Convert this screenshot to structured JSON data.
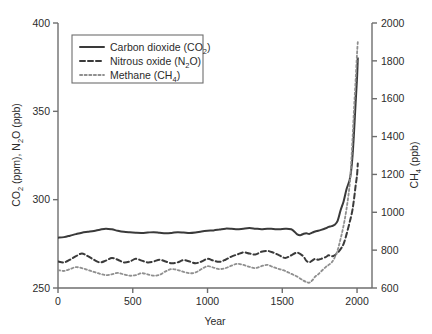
{
  "chart_data": {
    "type": "line",
    "title": "",
    "xlabel": "Year",
    "ylabel_left": "CO2 (ppm), N2O (ppb)",
    "ylabel_right": "CH4 (ppb)",
    "xlim": [
      0,
      2100
    ],
    "ylim_left": [
      250,
      400
    ],
    "ylim_right": [
      600,
      2000
    ],
    "xticks": [
      0,
      500,
      1000,
      1500,
      2000
    ],
    "yticks_left": [
      250,
      300,
      350,
      400
    ],
    "yticks_right": [
      600,
      800,
      1000,
      1200,
      1400,
      1600,
      1800,
      2000
    ],
    "grid": false,
    "legend_position": "top-left-inside",
    "series": [
      {
        "name": "Carbon dioxide (CO2)",
        "legend_label": "Carbon dioxide (CO₂)",
        "axis": "left",
        "units": "ppm",
        "style": "solid",
        "color": "#3a3a3a",
        "width": 2.0,
        "x": [
          0,
          40,
          80,
          120,
          160,
          200,
          240,
          280,
          320,
          360,
          400,
          440,
          480,
          520,
          560,
          600,
          640,
          680,
          720,
          760,
          800,
          840,
          880,
          920,
          960,
          1000,
          1040,
          1080,
          1120,
          1160,
          1200,
          1240,
          1280,
          1320,
          1360,
          1400,
          1440,
          1480,
          1520,
          1560,
          1580,
          1600,
          1620,
          1640,
          1660,
          1680,
          1700,
          1720,
          1740,
          1760,
          1790,
          1810,
          1830,
          1850,
          1870,
          1890,
          1910,
          1930,
          1950,
          1960,
          1970,
          1980,
          1990,
          2000,
          2005
        ],
        "y": [
          278.5,
          278.8,
          279.6,
          280.5,
          281.3,
          281.8,
          282.3,
          283.0,
          283.6,
          283.2,
          282.4,
          281.8,
          281.5,
          281.3,
          281.2,
          281.4,
          281.6,
          281.3,
          281.0,
          281.2,
          281.6,
          281.4,
          281.1,
          281.4,
          282.0,
          282.4,
          282.6,
          283.1,
          283.6,
          283.5,
          283.2,
          283.6,
          283.9,
          283.6,
          283.3,
          283.6,
          283.4,
          283.2,
          283.5,
          283.3,
          282.0,
          280.4,
          279.9,
          280.6,
          281.0,
          280.6,
          281.3,
          282.0,
          282.4,
          282.9,
          283.8,
          284.6,
          285.0,
          285.8,
          288.0,
          294.0,
          299.0,
          306.0,
          311.0,
          316.0,
          325.0,
          338.5,
          354.0,
          369.0,
          380.0
        ]
      },
      {
        "name": "Nitrous oxide (N2O)",
        "legend_label": "Nitrous oxide (N₂O)",
        "axis": "left",
        "units": "ppb",
        "style": "dashed",
        "color": "#3a3a3a",
        "width": 2.0,
        "x": [
          0,
          40,
          80,
          120,
          160,
          200,
          240,
          280,
          320,
          360,
          400,
          440,
          480,
          520,
          560,
          600,
          640,
          680,
          720,
          760,
          800,
          840,
          880,
          920,
          960,
          1000,
          1040,
          1080,
          1120,
          1160,
          1200,
          1240,
          1280,
          1320,
          1360,
          1400,
          1440,
          1480,
          1520,
          1560,
          1600,
          1640,
          1660,
          1680,
          1700,
          1720,
          1740,
          1760,
          1790,
          1810,
          1830,
          1850,
          1870,
          1890,
          1910,
          1930,
          1950,
          1960,
          1970,
          1980,
          1990,
          2000,
          2005
        ],
        "y": [
          265.0,
          264.5,
          266.0,
          268.0,
          269.5,
          268.0,
          266.0,
          264.5,
          265.5,
          267.0,
          266.0,
          264.5,
          265.0,
          266.5,
          265.5,
          264.5,
          265.0,
          266.0,
          265.0,
          264.0,
          264.5,
          265.8,
          265.0,
          264.0,
          265.0,
          266.5,
          265.5,
          264.8,
          266.0,
          267.8,
          269.0,
          270.2,
          269.5,
          269.0,
          270.5,
          271.0,
          270.0,
          268.5,
          267.0,
          268.5,
          270.0,
          268.0,
          265.5,
          264.5,
          265.5,
          266.5,
          266.0,
          266.5,
          267.5,
          268.5,
          268.0,
          268.5,
          270.0,
          272.0,
          275.0,
          280.5,
          287.0,
          290.5,
          294.5,
          300.5,
          307.5,
          314.0,
          320.5
        ]
      },
      {
        "name": "Methane (CH4)",
        "legend_label": "Methane (CH₄)",
        "axis": "right",
        "units": "ppb",
        "style": "dotted",
        "color": "#8f8f8f",
        "width": 1.8,
        "x": [
          0,
          40,
          80,
          120,
          160,
          200,
          240,
          280,
          320,
          360,
          400,
          440,
          480,
          520,
          560,
          600,
          640,
          680,
          720,
          760,
          800,
          840,
          880,
          920,
          960,
          1000,
          1040,
          1080,
          1120,
          1160,
          1200,
          1240,
          1280,
          1320,
          1360,
          1400,
          1440,
          1480,
          1520,
          1560,
          1600,
          1640,
          1660,
          1680,
          1700,
          1720,
          1740,
          1760,
          1790,
          1810,
          1830,
          1850,
          1870,
          1890,
          1910,
          1930,
          1950,
          1960,
          1970,
          1980,
          1990,
          2000,
          2005
        ],
        "y": [
          695,
          690,
          700,
          710,
          705,
          695,
          685,
          675,
          668,
          672,
          680,
          672,
          665,
          668,
          678,
          672,
          665,
          670,
          688,
          700,
          695,
          685,
          678,
          682,
          700,
          715,
          708,
          700,
          705,
          718,
          728,
          722,
          712,
          705,
          715,
          722,
          710,
          700,
          690,
          675,
          660,
          640,
          632,
          628,
          640,
          660,
          672,
          688,
          710,
          722,
          735,
          760,
          800,
          860,
          930,
          1020,
          1140,
          1250,
          1390,
          1550,
          1690,
          1840,
          1900
        ]
      }
    ]
  },
  "axes": {
    "left_title_parts": {
      "a": "CO",
      "a_sub": "2",
      "b": " (ppm), N",
      "b_sub": "2",
      "c": "O (ppb)"
    },
    "right_title_parts": {
      "a": "CH",
      "a_sub": "4",
      "b": " (ppb)"
    },
    "x_title": "Year"
  },
  "legend": {
    "items": [
      {
        "label_main": "Carbon dioxide (CO",
        "label_sub": "2",
        "label_tail": ")",
        "style": "solid"
      },
      {
        "label_main": "Nitrous oxide (N",
        "label_sub": "2",
        "label_tail": "O)",
        "style": "dashed"
      },
      {
        "label_main": "Methane (CH",
        "label_sub": "4",
        "label_tail": ")",
        "style": "dotted"
      }
    ]
  }
}
